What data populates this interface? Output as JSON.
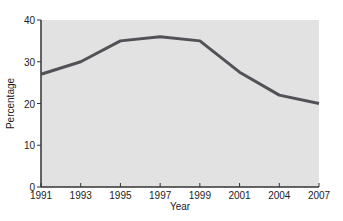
{
  "chart_data": {
    "type": "line",
    "title": "",
    "xlabel": "Year",
    "ylabel": "Percentage",
    "categories": [
      "1991",
      "1993",
      "1995",
      "1997",
      "1999",
      "2001",
      "2004",
      "2007"
    ],
    "series": [
      {
        "name": "Percentage",
        "values": [
          27,
          30,
          35,
          36,
          35,
          27.5,
          22,
          20
        ]
      }
    ],
    "yticks": [
      "0",
      "10",
      "20",
      "30",
      "40"
    ],
    "ylim": [
      0,
      40
    ],
    "grid": false,
    "legend": "none",
    "colors": {
      "line": "#505258",
      "plot_bg": "#e2e2e2",
      "axis": "#333333"
    }
  }
}
